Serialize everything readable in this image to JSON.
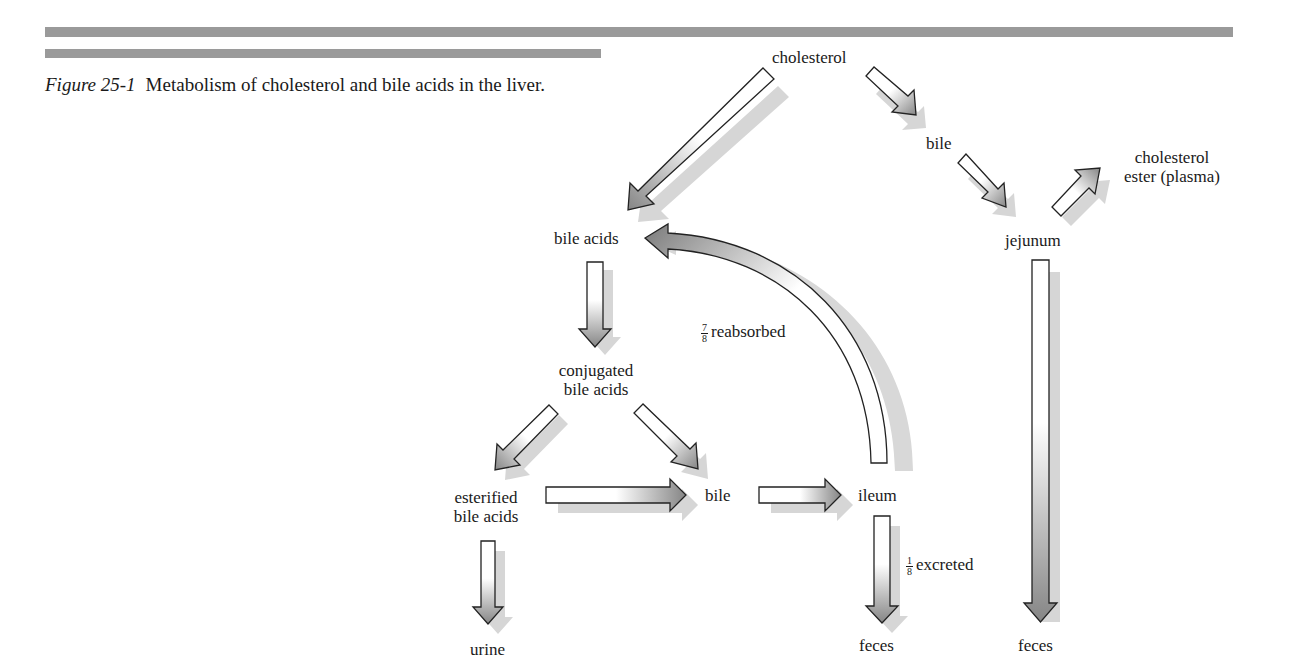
{
  "header": {
    "figure_number": "Figure 25-1",
    "caption": "Metabolism of cholesterol and bile acids in the liver."
  },
  "diagram": {
    "nodes": {
      "cholesterol": "cholesterol",
      "bile_top": "bile",
      "cholesterol_ester_line1": "cholesterol",
      "cholesterol_ester_line2": "ester (plasma)",
      "jejunum": "jejunum",
      "bile_acids": "bile acids",
      "conjugated_line1": "conjugated",
      "conjugated_line2": "bile acids",
      "esterified_line1": "esterified",
      "esterified_line2": "bile acids",
      "bile_mid": "bile",
      "ileum": "ileum",
      "urine": "urine",
      "feces_ileum": "feces",
      "feces_jejunum": "feces"
    },
    "edge_labels": {
      "reabsorbed_num": "7",
      "reabsorbed_den": "8",
      "reabsorbed_text": "reabsorbed",
      "excreted_num": "1",
      "excreted_den": "8",
      "excreted_text": "excreted"
    },
    "edges": [
      {
        "from": "cholesterol",
        "to": "bile acids"
      },
      {
        "from": "cholesterol",
        "to": "bile"
      },
      {
        "from": "bile",
        "to": "jejunum"
      },
      {
        "from": "jejunum",
        "to": "cholesterol ester (plasma)"
      },
      {
        "from": "jejunum",
        "to": "feces"
      },
      {
        "from": "bile acids",
        "to": "conjugated bile acids"
      },
      {
        "from": "conjugated bile acids",
        "to": "esterified bile acids"
      },
      {
        "from": "conjugated bile acids",
        "to": "bile"
      },
      {
        "from": "esterified bile acids",
        "to": "bile"
      },
      {
        "from": "bile",
        "to": "ileum"
      },
      {
        "from": "ileum",
        "to": "bile acids",
        "label": "7/8 reabsorbed"
      },
      {
        "from": "ileum",
        "to": "feces",
        "label": "1/8 excreted"
      },
      {
        "from": "esterified bile acids",
        "to": "urine"
      }
    ],
    "colors": {
      "rule": "#9a9a9a",
      "arrow_outline": "#222222",
      "arrow_fill_start": "#ffffff",
      "arrow_fill_end": "#8a8a8a",
      "shadow": "#d0d0d0"
    }
  }
}
